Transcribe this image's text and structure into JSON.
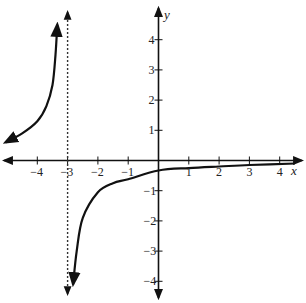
{
  "chart_data": {
    "type": "line",
    "title": "",
    "xlabel": "x",
    "ylabel": "y",
    "function": "y = -1/(x+3)",
    "xlim": [
      -5.2,
      4.6
    ],
    "ylim": [
      -4.6,
      5.3
    ],
    "x_ticks": [
      -4,
      -3,
      -2,
      -1,
      1,
      2,
      3,
      4
    ],
    "x_tick_labels": [
      "−4",
      "−3",
      "−2",
      "−1",
      "1",
      "2",
      "3",
      "4"
    ],
    "y_ticks": [
      4,
      3,
      2,
      1,
      -1,
      -2,
      -3,
      -4
    ],
    "y_tick_labels": [
      "4",
      "3",
      "2",
      "1",
      "−1",
      "−2",
      "−3",
      "−4"
    ],
    "vertical_asymptote": {
      "x": -3,
      "style": "dashed"
    },
    "horizontal_asymptote": {
      "y": 0
    },
    "series": [
      {
        "name": "left branch",
        "x": [
          -5.05,
          -4.5,
          -4.0,
          -3.7,
          -3.5,
          -3.4,
          -3.34
        ],
        "y": [
          0.6,
          0.9,
          1.3,
          1.8,
          2.5,
          3.5,
          4.5
        ]
      },
      {
        "name": "right branch",
        "x": [
          -2.82,
          -2.7,
          -2.5,
          -2.0,
          -1.5,
          -1.0,
          0,
          1,
          2,
          3,
          4.5
        ],
        "y": [
          -4.1,
          -3.0,
          -1.9,
          -1.05,
          -0.75,
          -0.62,
          -0.33,
          -0.25,
          -0.2,
          -0.15,
          -0.1
        ]
      }
    ],
    "grid": false,
    "legend": null
  },
  "labels": {
    "x_axis": "x",
    "y_axis": "y"
  }
}
